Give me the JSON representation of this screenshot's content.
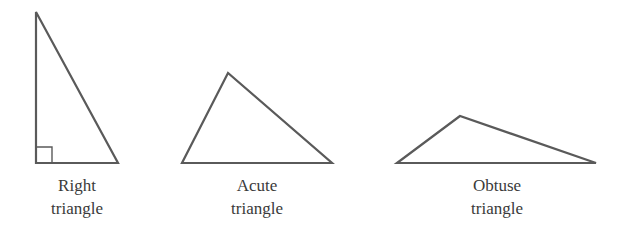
{
  "diagram": {
    "triangles": [
      {
        "id": "right",
        "label_line1": "Right",
        "label_line2": "triangle",
        "points": "36,12 36,163 118,163",
        "right_angle_marker": "36,147 52,147 52,163",
        "label_x": 77
      },
      {
        "id": "acute",
        "label_line1": "Acute",
        "label_line2": "triangle",
        "points": "228,73 182,163 332,163",
        "label_x": 257
      },
      {
        "id": "obtuse",
        "label_line1": "Obtuse",
        "label_line2": "triangle",
        "points": "460,116 397,163 596,163",
        "label_x": 497
      }
    ],
    "colors": {
      "stroke": "#5a5a5a",
      "text": "#3a3a3a",
      "background": "#ffffff"
    }
  }
}
